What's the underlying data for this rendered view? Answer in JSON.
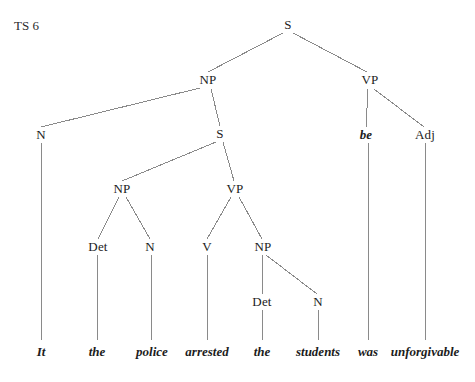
{
  "figure": {
    "label": "TS 6"
  },
  "diagram": {
    "type": "syntax-tree",
    "sentence": "It the police arrested the students was unforgivable",
    "line_color": "#8a8a8a",
    "text_color": "#1c1c1c",
    "background": "#ffffff",
    "nodes": [
      {
        "id": "s-root",
        "label": "S",
        "x": 288,
        "y": 25,
        "style": "upright"
      },
      {
        "id": "np-outer",
        "label": "NP",
        "x": 208,
        "y": 80,
        "style": "upright"
      },
      {
        "id": "vp-outer",
        "label": "VP",
        "x": 370,
        "y": 80,
        "style": "upright"
      },
      {
        "id": "n-it",
        "label": "N",
        "x": 41,
        "y": 135,
        "style": "upright"
      },
      {
        "id": "s-inner",
        "label": "S",
        "x": 220,
        "y": 134,
        "style": "upright"
      },
      {
        "id": "be",
        "label": "be",
        "x": 366,
        "y": 135,
        "style": "italic"
      },
      {
        "id": "adj",
        "label": "Adj",
        "x": 425,
        "y": 135,
        "style": "upright"
      },
      {
        "id": "np-inner",
        "label": "NP",
        "x": 122,
        "y": 189,
        "style": "upright"
      },
      {
        "id": "vp-inner",
        "label": "VP",
        "x": 235,
        "y": 189,
        "style": "upright"
      },
      {
        "id": "det-the1",
        "label": "Det",
        "x": 98,
        "y": 247,
        "style": "upright"
      },
      {
        "id": "n-police",
        "label": "N",
        "x": 150,
        "y": 247,
        "style": "upright"
      },
      {
        "id": "v-arrested",
        "label": "V",
        "x": 207,
        "y": 247,
        "style": "upright"
      },
      {
        "id": "np-object",
        "label": "NP",
        "x": 263,
        "y": 247,
        "style": "upright"
      },
      {
        "id": "det-the2",
        "label": "Det",
        "x": 262,
        "y": 302,
        "style": "upright"
      },
      {
        "id": "n-students",
        "label": "N",
        "x": 318,
        "y": 302,
        "style": "upright"
      }
    ],
    "terminals": [
      {
        "id": "t-it",
        "label": "It",
        "x": 41,
        "y": 352
      },
      {
        "id": "t-the1",
        "label": "the",
        "x": 97,
        "y": 352
      },
      {
        "id": "t-police",
        "label": "police",
        "x": 152,
        "y": 352
      },
      {
        "id": "t-arrested",
        "label": "arrested",
        "x": 207,
        "y": 352
      },
      {
        "id": "t-the2",
        "label": "the",
        "x": 262,
        "y": 352
      },
      {
        "id": "t-students",
        "label": "students",
        "x": 318,
        "y": 352
      },
      {
        "id": "t-was",
        "label": "was",
        "x": 368,
        "y": 352
      },
      {
        "id": "t-unforgivable",
        "label": "unforgivable",
        "x": 425,
        "y": 352
      }
    ],
    "edges": [
      {
        "from": "s-root",
        "to": "np-outer",
        "x1": 283,
        "y1": 33,
        "x2": 208,
        "y2": 72
      },
      {
        "from": "s-root",
        "to": "vp-outer",
        "x1": 293,
        "y1": 33,
        "x2": 367,
        "y2": 72
      },
      {
        "from": "np-outer",
        "to": "n-it",
        "x1": 200,
        "y1": 88,
        "x2": 41,
        "y2": 127
      },
      {
        "from": "np-outer",
        "to": "s-inner",
        "x1": 211,
        "y1": 89,
        "x2": 220,
        "y2": 126
      },
      {
        "from": "vp-outer",
        "to": "be",
        "x1": 368,
        "y1": 89,
        "x2": 366,
        "y2": 127
      },
      {
        "from": "vp-outer",
        "to": "adj",
        "x1": 374,
        "y1": 89,
        "x2": 424,
        "y2": 127
      },
      {
        "from": "s-inner",
        "to": "np-inner",
        "x1": 216,
        "y1": 142,
        "x2": 122,
        "y2": 181
      },
      {
        "from": "s-inner",
        "to": "vp-inner",
        "x1": 223,
        "y1": 142,
        "x2": 234,
        "y2": 181
      },
      {
        "from": "np-inner",
        "to": "det-the1",
        "x1": 119,
        "y1": 197,
        "x2": 98,
        "y2": 239
      },
      {
        "from": "np-inner",
        "to": "n-police",
        "x1": 126,
        "y1": 197,
        "x2": 150,
        "y2": 239
      },
      {
        "from": "vp-inner",
        "to": "v-arrested",
        "x1": 231,
        "y1": 197,
        "x2": 207,
        "y2": 239
      },
      {
        "from": "vp-inner",
        "to": "np-object",
        "x1": 239,
        "y1": 197,
        "x2": 262,
        "y2": 239
      },
      {
        "from": "np-object",
        "to": "det-the2",
        "x1": 262,
        "y1": 255,
        "x2": 262,
        "y2": 294
      },
      {
        "from": "np-object",
        "to": "n-students",
        "x1": 266,
        "y1": 255,
        "x2": 317,
        "y2": 294
      },
      {
        "from": "n-it",
        "to": "t-it",
        "x1": 41,
        "y1": 143,
        "x2": 41,
        "y2": 340
      },
      {
        "from": "det-the1",
        "to": "t-the1",
        "x1": 97,
        "y1": 255,
        "x2": 97,
        "y2": 340
      },
      {
        "from": "n-police",
        "to": "t-police",
        "x1": 151,
        "y1": 255,
        "x2": 151,
        "y2": 340
      },
      {
        "from": "v-arrested",
        "to": "t-arrested",
        "x1": 207,
        "y1": 255,
        "x2": 207,
        "y2": 340
      },
      {
        "from": "det-the2",
        "to": "t-the2",
        "x1": 262,
        "y1": 310,
        "x2": 262,
        "y2": 340
      },
      {
        "from": "n-students",
        "to": "t-students",
        "x1": 318,
        "y1": 310,
        "x2": 318,
        "y2": 340
      },
      {
        "from": "be",
        "to": "t-was",
        "x1": 368,
        "y1": 143,
        "x2": 368,
        "y2": 340
      },
      {
        "from": "adj",
        "to": "t-unforgivable",
        "x1": 425,
        "y1": 143,
        "x2": 425,
        "y2": 340
      }
    ]
  }
}
